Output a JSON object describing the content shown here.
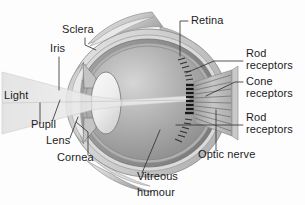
{
  "diagram": {
    "type": "anatomical-cross-section",
    "background_color": "#fdfdfd",
    "text_color": "#1c1c1c",
    "leader_line_color": "#2b2b2b",
    "palette": {
      "sclera_outer": "#d8d8d8",
      "sclera_mid": "#bfbfbf",
      "choroid": "#8f8f8f",
      "retina_band": "#a8a8a8",
      "vitreous_light": "#d2d2d2",
      "vitreous_dark": "#8a8a8a",
      "lens_fill": "#f2f2f2",
      "light_beam": "#e3e3e3",
      "cornea": "#cfcfcf",
      "optic_nerve": "#b5b5b5"
    },
    "labels": [
      {
        "id": "sclera",
        "text": "Sclera",
        "x": 62,
        "y": 33,
        "anchor": "start"
      },
      {
        "id": "iris",
        "text": "Iris",
        "x": 50,
        "y": 52,
        "anchor": "start"
      },
      {
        "id": "light",
        "text": "Light",
        "x": 4,
        "y": 99,
        "anchor": "start"
      },
      {
        "id": "pupil",
        "text": "Pupil",
        "x": 31,
        "y": 128,
        "anchor": "start"
      },
      {
        "id": "lens",
        "text": "Lens",
        "x": 46,
        "y": 144,
        "anchor": "start"
      },
      {
        "id": "cornea",
        "text": "Cornea",
        "x": 57,
        "y": 161,
        "anchor": "start"
      },
      {
        "id": "retina",
        "text": "Retina",
        "x": 191,
        "y": 24,
        "anchor": "start"
      },
      {
        "id": "rod-receptors-1a",
        "text": "Rod",
        "x": 246,
        "y": 57,
        "anchor": "start"
      },
      {
        "id": "rod-receptors-1b",
        "text": "receptors",
        "x": 246,
        "y": 69,
        "anchor": "start"
      },
      {
        "id": "cone-receptors-a",
        "text": "Cone",
        "x": 246,
        "y": 85,
        "anchor": "start"
      },
      {
        "id": "cone-receptors-b",
        "text": "receptors",
        "x": 246,
        "y": 97,
        "anchor": "start"
      },
      {
        "id": "rod-receptors-2a",
        "text": "Rod",
        "x": 246,
        "y": 121,
        "anchor": "start"
      },
      {
        "id": "rod-receptors-2b",
        "text": "receptors",
        "x": 246,
        "y": 133,
        "anchor": "start"
      },
      {
        "id": "optic-nerve",
        "text": "Optic nerve",
        "x": 198,
        "y": 158,
        "anchor": "start"
      },
      {
        "id": "vitreous-a",
        "text": "Vitreous",
        "x": 137,
        "y": 180,
        "anchor": "start"
      },
      {
        "id": "vitreous-b",
        "text": "humour",
        "x": 137,
        "y": 196,
        "anchor": "start"
      }
    ],
    "leaders": [
      {
        "id": "leader-sclera",
        "d": "M 85 38 L 85 45 L 96 50"
      },
      {
        "id": "leader-iris",
        "d": "M 59 57 L 59 90"
      },
      {
        "id": "leader-light",
        "d": "M 40 103 L 40 123"
      },
      {
        "id": "leader-pupil",
        "d": "M 52 122 L 60 100"
      },
      {
        "id": "leader-lens",
        "d": "M 70 138 L 78 117"
      },
      {
        "id": "leader-cornea",
        "d": "M 88 155 L 88 132 L 76 122"
      },
      {
        "id": "leader-retina",
        "d": "M 188 21 L 180 21 L 180 56"
      },
      {
        "id": "leader-rod-1",
        "d": "M 243 61 L 214 61 L 186 73"
      },
      {
        "id": "leader-cone",
        "d": "M 243 82 L 235 82 L 206 96"
      },
      {
        "id": "leader-rod-2",
        "d": "M 243 125 L 176 125"
      },
      {
        "id": "leader-optic-nerve",
        "d": "M 216 151 L 216 110"
      },
      {
        "id": "leader-vitreous",
        "d": "M 142 173 L 160 130"
      }
    ],
    "structures": [
      {
        "id": "eyeball",
        "name": "eyeball-globe"
      },
      {
        "id": "sclera-layer",
        "name": "sclera-layer"
      },
      {
        "id": "choroid-layer",
        "name": "choroid-layer"
      },
      {
        "id": "retina-layer",
        "name": "retina-layer"
      },
      {
        "id": "vitreous-body",
        "name": "vitreous-humour-body"
      },
      {
        "id": "lens-body",
        "name": "lens-body"
      },
      {
        "id": "cornea-body",
        "name": "cornea-body"
      },
      {
        "id": "iris-upper",
        "name": "iris-upper-leaf"
      },
      {
        "id": "iris-lower",
        "name": "iris-lower-leaf"
      },
      {
        "id": "light-beam",
        "name": "light-beam-wedge"
      },
      {
        "id": "optic-nerve",
        "name": "optic-nerve-bundle"
      },
      {
        "id": "receptors",
        "name": "photoreceptor-ticks"
      },
      {
        "id": "muscle-top",
        "name": "extraocular-muscle-top"
      },
      {
        "id": "muscle-bottom",
        "name": "extraocular-muscle-bottom"
      }
    ]
  }
}
